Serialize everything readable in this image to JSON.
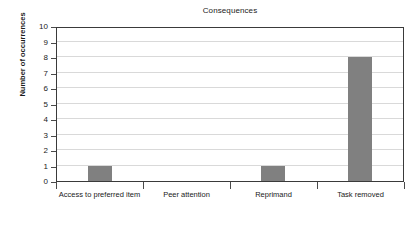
{
  "chart_data": {
    "type": "bar",
    "title": "Consequences",
    "xlabel": "",
    "ylabel": "Number of occurrences",
    "categories": [
      "Access to preferred item",
      "Peer attention",
      "Reprimand",
      "Task removed"
    ],
    "values": [
      1,
      0,
      1,
      8
    ],
    "ylim": [
      0,
      10
    ],
    "ytick_labels": [
      "10",
      "9",
      "8",
      "7",
      "6",
      "5",
      "4",
      "3",
      "2",
      "1",
      "0"
    ],
    "ytick_values": [
      10,
      9,
      8,
      7,
      6,
      5,
      4,
      3,
      2,
      1,
      0
    ],
    "grid": true,
    "legend": false,
    "bar_color": "#808080",
    "grid_color": "#d9d9d9",
    "axis_color": "#3a3a3a",
    "background": "#ffffff"
  }
}
